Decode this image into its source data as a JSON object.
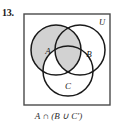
{
  "problem": {
    "number": "13."
  },
  "diagram": {
    "universe_label": "U",
    "set_labels": {
      "a": "A",
      "b": "B",
      "c": "C"
    },
    "caption": "A ∩ (B ∪ C′)",
    "colors": {
      "shading": "#d2d2d2",
      "stroke": "#1a1a1a",
      "box_stroke": "#4a4a4a",
      "background": "#ffffff",
      "text": "#1a1a1a"
    },
    "geometry": {
      "box": {
        "x": 1,
        "y": 1,
        "width": 86,
        "height": 91
      },
      "circle_a": {
        "cx": 33,
        "cy": 37,
        "r": 25
      },
      "circle_b": {
        "cx": 57,
        "cy": 37,
        "r": 25
      },
      "circle_c": {
        "cx": 45,
        "cy": 58,
        "r": 25
      }
    },
    "shaded_description": "A ∩ (B ∪ C′)"
  }
}
